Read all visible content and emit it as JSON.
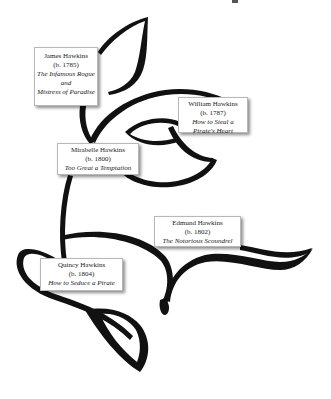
{
  "diagram": {
    "type": "family-tree",
    "nodes": [
      {
        "id": "james",
        "name": "James Hawkins",
        "born": "(b. 1785)",
        "titles": [
          "The Infamous Rogue",
          "Mistress of Paradise"
        ],
        "conjunction": "and"
      },
      {
        "id": "william",
        "name": "William Hawkins",
        "born": "(b. 1787)",
        "titles": [
          "How to Steal a Pirate's Heart"
        ]
      },
      {
        "id": "mirabelle",
        "name": "Mirabelle Hawkins",
        "born": "(b. 1800)",
        "titles": [
          "Too Great a Temptation"
        ]
      },
      {
        "id": "edmund",
        "name": "Edmund Hawkins",
        "born": "(b. 1802)",
        "titles": [
          "The Notorious Scoundrel"
        ]
      },
      {
        "id": "quincy",
        "name": "Quincy Hawkins",
        "born": "(b. 1804)",
        "titles": [
          "How to Seduce a Pirate"
        ]
      }
    ],
    "colors": {
      "swirl": "#111111",
      "box_border": "#b8b8b8",
      "box_bg": "#ffffff",
      "text": "#222222"
    }
  }
}
